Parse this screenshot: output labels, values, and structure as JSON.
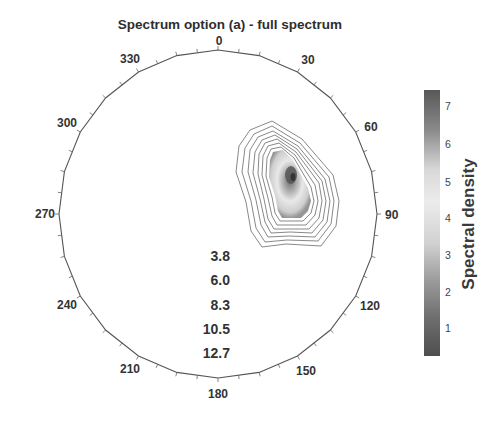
{
  "chart_data": {
    "type": "heatmap",
    "subtype": "polar-contour",
    "title": "Spectrum option (a) - full spectrum",
    "angular_axis": {
      "ticks": [
        0,
        30,
        60,
        90,
        120,
        150,
        180,
        210,
        240,
        270,
        300,
        330
      ],
      "tick_labels": [
        "0",
        "30",
        "60",
        "90",
        "120",
        "150",
        "180",
        "210",
        "240",
        "270",
        "300",
        "330"
      ],
      "direction": "clockwise",
      "zero_at": "top",
      "minor_tick_step_deg": 15
    },
    "radial_axis": {
      "labels": [
        "3.8",
        "6.0",
        "8.3",
        "10.5",
        "12.7"
      ],
      "values": [
        3.8,
        6.0,
        8.3,
        10.5,
        12.7
      ]
    },
    "colorbar": {
      "label": "Spectral density",
      "ticks": [
        1,
        2,
        3,
        4,
        5,
        6,
        7
      ],
      "tick_labels": [
        "1",
        "2",
        "3",
        "4",
        "5",
        "6",
        "7"
      ],
      "range": [
        0,
        7.5
      ]
    },
    "peak": {
      "direction_deg_approx": 45,
      "value_approx": 7,
      "description": "Single energy peak concentrated in the 30–90° sector"
    },
    "grid": false,
    "legend_position": "right"
  },
  "colors": {
    "axis": "#555555",
    "contour": "#6a6a6a",
    "text": "#333333"
  }
}
